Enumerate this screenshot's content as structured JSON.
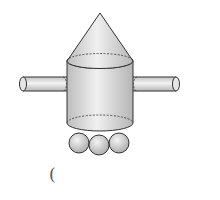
{
  "figure": {
    "parts": [
      {
        "shape": "cone",
        "position": "top"
      },
      {
        "shape": "cylinder",
        "position": "body"
      },
      {
        "shape": "cylinder",
        "position": "left-arm"
      },
      {
        "shape": "cylinder",
        "position": "right-arm"
      },
      {
        "shape": "sphere",
        "position": "bottom-left"
      },
      {
        "shape": "sphere",
        "position": "bottom-middle"
      },
      {
        "shape": "sphere",
        "position": "bottom-right"
      }
    ],
    "colors": {
      "fill": "#d9d9d9",
      "stroke": "#333333",
      "highlight": "#f2f2f2"
    }
  },
  "answer_blank": {
    "text": "("
  }
}
